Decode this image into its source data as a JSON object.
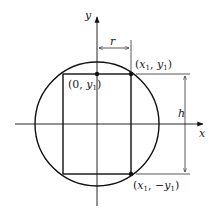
{
  "diagram": {
    "type": "geometry",
    "axes": {
      "x_label": "x",
      "y_label": "y"
    },
    "labels": {
      "radius": "r",
      "height": "h",
      "point_top_center": {
        "open": "(0, ",
        "var": "y",
        "sub": "1",
        "close": ")"
      },
      "point_top_right": {
        "open": "(",
        "var1": "x",
        "sub1": "1",
        "mid": ", ",
        "var2": "y",
        "sub2": "1",
        "close": ")"
      },
      "point_bottom_right": {
        "open": "(",
        "var1": "x",
        "sub1": "1",
        "mid": ", −",
        "var2": "y",
        "sub2": "1",
        "close": ")"
      }
    },
    "colors": {
      "stroke": "#111111",
      "text": "#222222",
      "background": "#ffffff"
    }
  }
}
